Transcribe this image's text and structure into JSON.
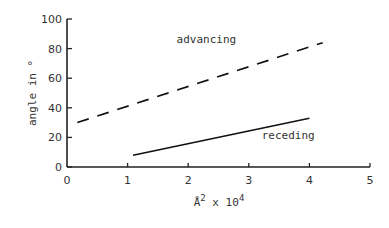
{
  "chart_data": {
    "type": "line",
    "title": "",
    "xlabel": "Å² x 10⁴",
    "xlabel_parts": {
      "base": "Å",
      "exp1": "2",
      "mid": " x 10",
      "exp2": "4"
    },
    "ylabel": "angle in °",
    "xlim": [
      0,
      5
    ],
    "ylim": [
      0,
      100
    ],
    "xticks": [
      "0",
      "1",
      "2",
      "3",
      "4",
      "5"
    ],
    "yticks": [
      "0",
      "20",
      "40",
      "60",
      "80",
      "100"
    ],
    "grid": false,
    "legend": "none (inline annotations)",
    "series": [
      {
        "name": "advancing",
        "style": "dashed",
        "x": [
          0.17,
          4.22
        ],
        "y": [
          30,
          84
        ]
      },
      {
        "name": "receding",
        "style": "solid",
        "x": [
          1.09,
          4.0
        ],
        "y": [
          8,
          33
        ]
      }
    ],
    "annotations": [
      {
        "text": "advancing",
        "x": 2.3,
        "y": 84
      },
      {
        "text": "receding",
        "x": 3.65,
        "y": 19
      }
    ]
  }
}
